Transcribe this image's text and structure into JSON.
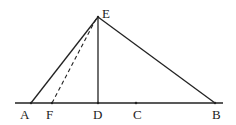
{
  "diagram": {
    "type": "geometry",
    "points": {
      "A": {
        "label": "A",
        "x": 31,
        "y": 103
      },
      "F": {
        "label": "F",
        "x": 52,
        "y": 103
      },
      "D": {
        "label": "D",
        "x": 98,
        "y": 103
      },
      "C": {
        "label": "C",
        "x": 136,
        "y": 103
      },
      "B": {
        "label": "B",
        "x": 215,
        "y": 103
      },
      "E": {
        "label": "E",
        "x": 98,
        "y": 17
      }
    },
    "segments": [
      {
        "from": "A",
        "to": "E",
        "style": "solid"
      },
      {
        "from": "E",
        "to": "B",
        "style": "solid"
      },
      {
        "from": "E",
        "to": "D",
        "style": "solid"
      },
      {
        "from": "F",
        "to": "E",
        "style": "dashed"
      },
      {
        "from": "line-left",
        "to": "line-right",
        "style": "solid"
      }
    ],
    "baseline": {
      "x1": 15,
      "x2": 223,
      "y": 103
    }
  }
}
